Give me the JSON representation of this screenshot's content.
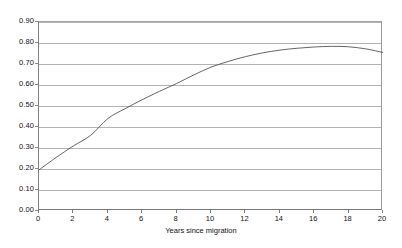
{
  "chart_data": {
    "type": "line",
    "title": "",
    "xlabel": "Years since migration",
    "ylabel": "",
    "xlim": [
      0,
      20
    ],
    "ylim": [
      0.0,
      0.9
    ],
    "grid": true,
    "legend": "none",
    "x_ticks": [
      "0",
      "2",
      "4",
      "6",
      "8",
      "10",
      "12",
      "14",
      "16",
      "18",
      "20"
    ],
    "x_tick_values": [
      0,
      2,
      4,
      6,
      8,
      10,
      12,
      14,
      16,
      18,
      20
    ],
    "y_ticks": [
      "0.00",
      "0.10",
      "0.20",
      "0.30",
      "0.40",
      "0.50",
      "0.60",
      "0.70",
      "0.80",
      "0.90"
    ],
    "y_tick_values": [
      0.0,
      0.1,
      0.2,
      0.3,
      0.4,
      0.5,
      0.6,
      0.7,
      0.8,
      0.9
    ],
    "series": [
      {
        "name": "predicted probability",
        "color": "#555555",
        "x": [
          0,
          1,
          2,
          3,
          4,
          5,
          6,
          7,
          8,
          9,
          10,
          11,
          12,
          13,
          14,
          15,
          16,
          17,
          18,
          19,
          20
        ],
        "values": [
          0.196,
          0.255,
          0.31,
          0.36,
          0.44,
          0.487,
          0.53,
          0.57,
          0.607,
          0.648,
          0.685,
          0.712,
          0.735,
          0.753,
          0.766,
          0.775,
          0.781,
          0.784,
          0.782,
          0.772,
          0.755
        ]
      }
    ]
  },
  "axis": {
    "x_title": "Years since migration"
  }
}
